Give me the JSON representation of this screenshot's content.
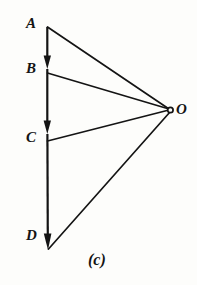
{
  "figure": {
    "caption": "(c)",
    "stroke_color": "#141414",
    "background_color": "#fdfdfb",
    "vertices": [
      {
        "id": "A",
        "label": "A",
        "x": 47,
        "y": 27
      },
      {
        "id": "B",
        "label": "B",
        "x": 47,
        "y": 73
      },
      {
        "id": "C",
        "label": "C",
        "x": 47,
        "y": 141
      },
      {
        "id": "D",
        "label": "D",
        "x": 48,
        "y": 248
      },
      {
        "id": "O",
        "label": "O",
        "x": 171,
        "y": 110
      }
    ],
    "segments": [
      {
        "from": "A",
        "to": "B",
        "arrow": true
      },
      {
        "from": "B",
        "to": "C",
        "arrow": true
      },
      {
        "from": "C",
        "to": "D",
        "arrow": true
      },
      {
        "from": "A",
        "to": "O",
        "arrow": false
      },
      {
        "from": "B",
        "to": "O",
        "arrow": false
      },
      {
        "from": "C",
        "to": "O",
        "arrow": false
      },
      {
        "from": "D",
        "to": "O",
        "arrow": false
      }
    ],
    "node_marker": {
      "at": "O",
      "shape": "open-circle",
      "radius": 2.6
    }
  }
}
